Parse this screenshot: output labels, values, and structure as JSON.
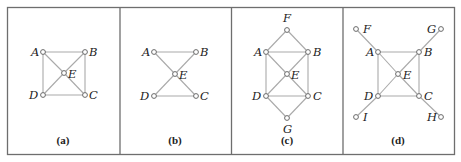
{
  "figure": {
    "frame": {
      "x": 7.5,
      "y": 7.5,
      "w": 447,
      "h": 147
    },
    "dividers": [
      120,
      231.5,
      343
    ],
    "panels": [
      {
        "id": "a",
        "caption": "(a)",
        "caption_pos": [
          63,
          144
        ],
        "nodes": {
          "A": [
            43,
            52
          ],
          "B": [
            85,
            52
          ],
          "E": [
            64,
            73
          ],
          "D": [
            43,
            95
          ],
          "C": [
            85,
            95
          ]
        },
        "labels": [
          {
            "text": "A",
            "x": 31,
            "y": 56
          },
          {
            "text": "B",
            "x": 89,
            "y": 56
          },
          {
            "text": "E",
            "x": 68,
            "y": 78
          },
          {
            "text": "D",
            "x": 29,
            "y": 99
          },
          {
            "text": "C",
            "x": 89,
            "y": 99
          }
        ],
        "edges": [
          [
            "A",
            "B"
          ],
          [
            "B",
            "C"
          ],
          [
            "C",
            "D"
          ],
          [
            "D",
            "A"
          ],
          [
            "A",
            "E"
          ],
          [
            "E",
            "C"
          ],
          [
            "B",
            "E"
          ],
          [
            "E",
            "D"
          ]
        ]
      },
      {
        "id": "b",
        "caption": "(b)",
        "caption_pos": [
          175,
          144
        ],
        "nodes": {
          "A": [
            154,
            52
          ],
          "B": [
            196,
            52
          ],
          "E": [
            175,
            74
          ],
          "D": [
            154,
            96
          ],
          "C": [
            196,
            96
          ]
        },
        "labels": [
          {
            "text": "A",
            "x": 142,
            "y": 56
          },
          {
            "text": "B",
            "x": 200,
            "y": 56
          },
          {
            "text": "E",
            "x": 179,
            "y": 79
          },
          {
            "text": "D",
            "x": 140,
            "y": 100
          },
          {
            "text": "C",
            "x": 200,
            "y": 100
          }
        ],
        "edges": [
          [
            "A",
            "B"
          ],
          [
            "D",
            "C"
          ],
          [
            "A",
            "E"
          ],
          [
            "E",
            "C"
          ],
          [
            "B",
            "E"
          ],
          [
            "E",
            "D"
          ]
        ]
      },
      {
        "id": "c",
        "caption": "(c)",
        "caption_pos": [
          287,
          144
        ],
        "nodes": {
          "F": [
            287,
            30
          ],
          "A": [
            266,
            52
          ],
          "B": [
            308,
            52
          ],
          "E": [
            287,
            74
          ],
          "D": [
            266,
            96
          ],
          "C": [
            308,
            96
          ],
          "G": [
            287,
            118
          ]
        },
        "labels": [
          {
            "text": "F",
            "x": 283,
            "y": 22
          },
          {
            "text": "A",
            "x": 254,
            "y": 56
          },
          {
            "text": "B",
            "x": 313,
            "y": 56
          },
          {
            "text": "E",
            "x": 291,
            "y": 79
          },
          {
            "text": "D",
            "x": 252,
            "y": 100
          },
          {
            "text": "C",
            "x": 313,
            "y": 100
          },
          {
            "text": "G",
            "x": 283,
            "y": 133
          }
        ],
        "edges": [
          [
            "F",
            "A"
          ],
          [
            "F",
            "B"
          ],
          [
            "A",
            "B"
          ],
          [
            "B",
            "C"
          ],
          [
            "C",
            "D"
          ],
          [
            "D",
            "A"
          ],
          [
            "A",
            "E"
          ],
          [
            "E",
            "C"
          ],
          [
            "B",
            "E"
          ],
          [
            "E",
            "D"
          ],
          [
            "D",
            "G"
          ],
          [
            "C",
            "G"
          ]
        ]
      },
      {
        "id": "d",
        "caption": "(d)",
        "caption_pos": [
          398,
          144
        ],
        "nodes": {
          "F": [
            356,
            29
          ],
          "G": [
            441,
            29
          ],
          "A": [
            378,
            52
          ],
          "B": [
            419,
            52
          ],
          "E": [
            398,
            74
          ],
          "D": [
            378,
            96
          ],
          "C": [
            419,
            96
          ],
          "I": [
            356,
            117
          ],
          "H": [
            441,
            117
          ]
        },
        "labels": [
          {
            "text": "F",
            "x": 363,
            "y": 33
          },
          {
            "text": "G",
            "x": 427,
            "y": 33
          },
          {
            "text": "A",
            "x": 366,
            "y": 56
          },
          {
            "text": "B",
            "x": 424,
            "y": 56
          },
          {
            "text": "E",
            "x": 403,
            "y": 79
          },
          {
            "text": "D",
            "x": 364,
            "y": 100
          },
          {
            "text": "C",
            "x": 424,
            "y": 100
          },
          {
            "text": "I",
            "x": 363,
            "y": 121
          },
          {
            "text": "H",
            "x": 427,
            "y": 121
          }
        ],
        "edges": [
          [
            "F",
            "A"
          ],
          [
            "A",
            "E"
          ],
          [
            "E",
            "C"
          ],
          [
            "C",
            "H"
          ],
          [
            "G",
            "B"
          ],
          [
            "B",
            "E"
          ],
          [
            "E",
            "D"
          ],
          [
            "D",
            "I"
          ],
          [
            "A",
            "B"
          ],
          [
            "B",
            "C"
          ],
          [
            "C",
            "D"
          ],
          [
            "D",
            "A"
          ]
        ]
      }
    ]
  }
}
